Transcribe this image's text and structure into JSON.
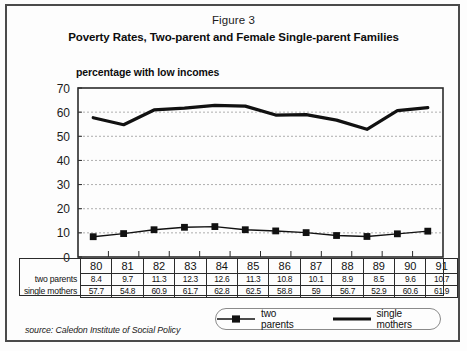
{
  "figure": {
    "label": "Figure 3",
    "title": "Poverty Rates, Two-parent and Female Single-parent Families",
    "axis_title": "percentage with low incomes",
    "source": "source: Caledon Institute of Social Policy"
  },
  "legend": {
    "items": [
      {
        "label": "two parents",
        "marker": "square-line",
        "color": "#111111"
      },
      {
        "label": "single mothers",
        "marker": "thick-line",
        "color": "#111111"
      }
    ]
  },
  "table": {
    "row_labels": [
      "two parents",
      "single mothers"
    ],
    "years": [
      "80",
      "81",
      "82",
      "83",
      "84",
      "85",
      "86",
      "87",
      "88",
      "89",
      "90",
      "91"
    ],
    "two_parents": [
      "8.4",
      "9.7",
      "11.3",
      "12.3",
      "12.6",
      "11.3",
      "10.8",
      "10.1",
      "8.9",
      "8.5",
      "9.6",
      "10.7"
    ],
    "single_mothers": [
      "57.7",
      "54.8",
      "60.9",
      "61.7",
      "62.8",
      "62.5",
      "58.8",
      "59",
      "56.7",
      "52.9",
      "60.6",
      "61.9"
    ]
  },
  "chart_data": {
    "type": "line",
    "title": "Poverty Rates, Two-parent and Female Single-parent Families",
    "subtitle": "Figure 3",
    "xlabel": "",
    "ylabel": "percentage with low incomes",
    "categories": [
      "80",
      "81",
      "82",
      "83",
      "84",
      "85",
      "86",
      "87",
      "88",
      "89",
      "90",
      "91"
    ],
    "ylim": [
      0,
      70
    ],
    "yticks": [
      0,
      10,
      20,
      30,
      40,
      50,
      60,
      70
    ],
    "grid": "horizontal-dashed",
    "legend_position": "bottom",
    "series": [
      {
        "name": "two parents",
        "marker": "square",
        "color": "#111111",
        "values": [
          8.4,
          9.7,
          11.3,
          12.3,
          12.6,
          11.3,
          10.8,
          10.1,
          8.9,
          8.5,
          9.6,
          10.7
        ]
      },
      {
        "name": "single mothers",
        "marker": "none",
        "color": "#111111",
        "values": [
          57.7,
          54.8,
          60.9,
          61.7,
          62.8,
          62.5,
          58.8,
          59,
          56.7,
          52.9,
          60.6,
          61.9
        ]
      }
    ]
  },
  "plot_geometry": {
    "left": 78,
    "right": 443,
    "top": 88,
    "bottom": 257
  }
}
